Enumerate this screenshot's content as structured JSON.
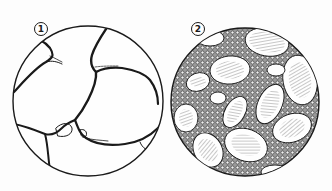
{
  "figure": {
    "panels": [
      {
        "label": "1",
        "description": "Circular section with large clear cells separated by thin septa"
      },
      {
        "label": "2",
        "description": "Circular section with hatched ovoid cells embedded in dense granular tissue"
      }
    ],
    "colors": {
      "ink": "#1a1a1a",
      "paper": "#fdfdfd",
      "granular": "#8a8a8a"
    }
  }
}
